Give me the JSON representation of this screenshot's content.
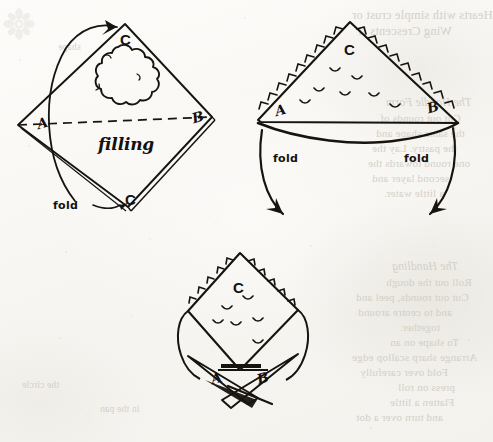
{
  "page": {
    "width": 493,
    "height": 442,
    "background_color": "#fbfaf8",
    "ink_color": "#17140f",
    "showthrough_color": "#cfcbc2"
  },
  "ornament": {
    "name": "floral-rosette-ornament",
    "color": "#d8d5cd"
  },
  "diagrams": [
    {
      "id": "step-1",
      "caption_labels": {
        "corner_top": "C",
        "corner_bottom": "C",
        "corner_left": "A",
        "corner_right": "B",
        "center_text": "filling",
        "fold_label": "fold"
      },
      "notes": "Square sheet set on point. Dashed centre line A–B. Scalloped mound of filling above the line. Curved arrow shows bottom corner C folding up to top corner C."
    },
    {
      "id": "step-2",
      "caption_labels": {
        "corner_top": "C",
        "corner_left": "A",
        "corner_right": "B",
        "fold_label_left": "fold",
        "fold_label_right": "fold"
      },
      "notes": "Triangle with crimped zig-zag sealed edges and a curved open bottom. Two curved arrows swing the A and B corners downward."
    },
    {
      "id": "step-3",
      "caption_labels": {
        "corner_top": "C",
        "corner_left": "A",
        "corner_right": "B"
      },
      "notes": "Finished shape: crimped diamond body with A and B points crossed and pinched together at the bottom."
    }
  ],
  "showthrough_text": {
    "description": "Mirror-reversed print bleeding through from the reverse of the leaf; only fragments are legible.",
    "top_right": [
      "Hearts with simple crust or",
      "Wing Crescents II"
    ],
    "middle_right": [
      "The Handle Form",
      "Cut out rounds of",
      "the same shape and",
      "the pastry. Lay the",
      "one round towards the",
      "second layer and",
      "a little water."
    ],
    "lower_right": [
      "The Handling",
      "Roll out the dough",
      "Cut out rounds, peel and",
      "and to centre around",
      "together.",
      "To shape on an",
      "Arrange sharp scallop edge",
      "Fold over carefully",
      "press on roll",
      "Flatten a little",
      "and turn over a dot"
    ],
    "lower_left": [
      "shape",
      "the circle",
      "in the pan"
    ]
  }
}
